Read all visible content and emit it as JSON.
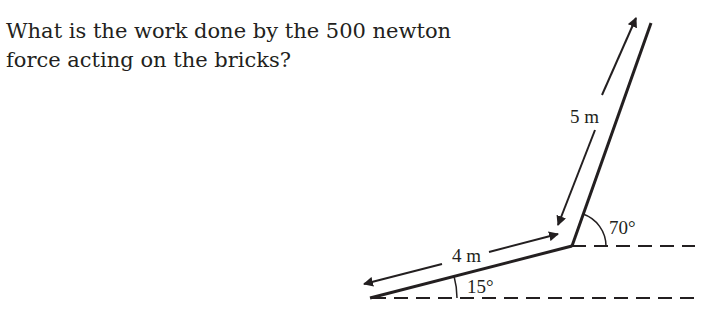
{
  "question": {
    "line1": "What is the work done by the 500 newton",
    "line2": "force acting on the bricks?"
  },
  "diagram": {
    "labels": {
      "upper_distance": "5 m",
      "lower_distance": "4 m",
      "upper_angle": "70°",
      "lower_angle": "15°"
    },
    "colors": {
      "ink": "#231f20",
      "background": "#ffffff"
    }
  }
}
